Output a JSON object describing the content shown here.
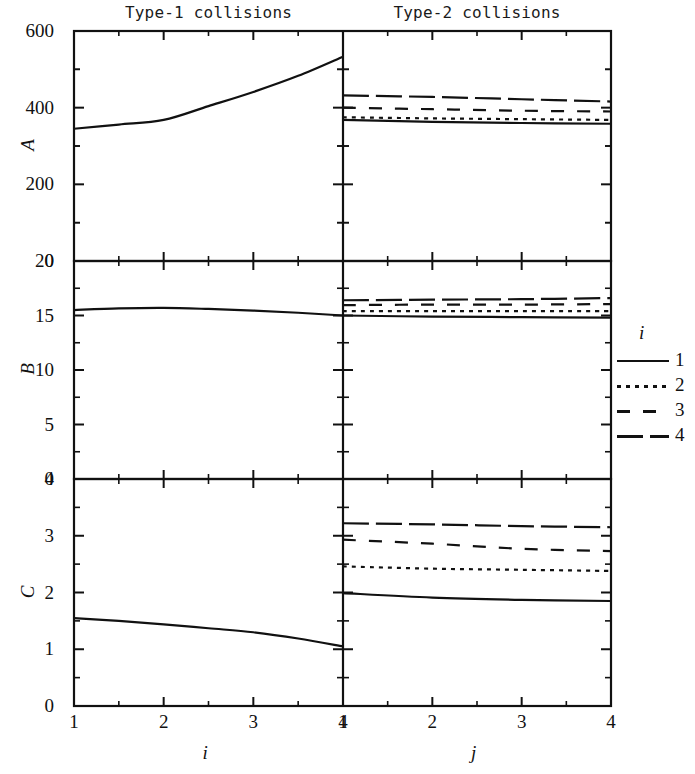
{
  "figure": {
    "width": 695,
    "height": 774,
    "background": "#ffffff",
    "ink_color": "#111111"
  },
  "columns": [
    {
      "id": "type1",
      "title": "Type-1 collisions",
      "xlabel": "i"
    },
    {
      "id": "type2",
      "title": "Type-2 collisions",
      "xlabel": "j"
    }
  ],
  "rows": [
    {
      "id": "A",
      "label": "A"
    },
    {
      "id": "B",
      "label": "B"
    },
    {
      "id": "C",
      "label": "C"
    }
  ],
  "legend": {
    "title": "i",
    "position": "right",
    "entries": [
      {
        "label": "1",
        "style": "solid"
      },
      {
        "label": "2",
        "style": "dotted"
      },
      {
        "label": "3",
        "style": "dashed"
      },
      {
        "label": "4",
        "style": "longdash"
      }
    ]
  },
  "chart_data": {
    "type": "line",
    "title": "",
    "layout": "3 rows (A, B, C) x 2 columns (Type-1 collisions, Type-2 collisions)",
    "grid": false,
    "legend_position": "right",
    "legend_title": "i",
    "panels": [
      {
        "row": "A",
        "column": "type1",
        "title": "Type-1 collisions",
        "xlabel": "i",
        "ylabel": "A",
        "xlim": [
          1,
          4
        ],
        "ylim": [
          0,
          600
        ],
        "xticks": [
          1,
          2,
          3,
          4
        ],
        "yticks": [
          0,
          200,
          400,
          600
        ],
        "yminorticks": [
          100,
          300,
          500
        ],
        "series": [
          {
            "name": "1",
            "style": "solid",
            "x": [
              1,
              1.5,
              2,
              2.5,
              3,
              3.5,
              4
            ],
            "values": [
              345,
              356,
              368,
              404,
              441,
              483,
              533
            ]
          }
        ]
      },
      {
        "row": "A",
        "column": "type2",
        "title": "Type-2 collisions",
        "xlabel": "j",
        "ylabel": "A",
        "xlim": [
          1,
          4
        ],
        "ylim": [
          0,
          600
        ],
        "xticks": [
          1,
          2,
          3,
          4
        ],
        "yticks": [
          0,
          200,
          400,
          600
        ],
        "yminorticks": [
          100,
          300,
          500
        ],
        "series": [
          {
            "name": "1",
            "style": "solid",
            "x": [
              1,
              2,
              3,
              4
            ],
            "values": [
              368,
              363,
              360,
              358
            ]
          },
          {
            "name": "2",
            "style": "dotted",
            "x": [
              1,
              2,
              3,
              4
            ],
            "values": [
              375,
              372,
              370,
              368
            ]
          },
          {
            "name": "3",
            "style": "dashed",
            "x": [
              1,
              2,
              3,
              4
            ],
            "values": [
              400,
              396,
              392,
              390
            ]
          },
          {
            "name": "4",
            "style": "longdash",
            "x": [
              1,
              2,
              3,
              4
            ],
            "values": [
              432,
              428,
              422,
              416
            ]
          }
        ]
      },
      {
        "row": "B",
        "column": "type1",
        "title": "",
        "xlabel": "i",
        "ylabel": "B",
        "xlim": [
          1,
          4
        ],
        "ylim": [
          0,
          20
        ],
        "xticks": [
          1,
          2,
          3,
          4
        ],
        "yticks": [
          0,
          5,
          10,
          15,
          20
        ],
        "series": [
          {
            "name": "1",
            "style": "solid",
            "x": [
              1,
              1.5,
              2,
              2.5,
              3,
              3.5,
              4
            ],
            "values": [
              15.5,
              15.65,
              15.7,
              15.6,
              15.45,
              15.25,
              15.0
            ]
          }
        ]
      },
      {
        "row": "B",
        "column": "type2",
        "title": "",
        "xlabel": "j",
        "ylabel": "B",
        "xlim": [
          1,
          4
        ],
        "ylim": [
          0,
          20
        ],
        "xticks": [
          1,
          2,
          3,
          4
        ],
        "yticks": [
          0,
          5,
          10,
          15,
          20
        ],
        "series": [
          {
            "name": "1",
            "style": "solid",
            "x": [
              1,
              2,
              3,
              4
            ],
            "values": [
              15.0,
              14.9,
              14.85,
              14.8
            ]
          },
          {
            "name": "2",
            "style": "dotted",
            "x": [
              1,
              2,
              3,
              4
            ],
            "values": [
              15.4,
              15.4,
              15.4,
              15.4
            ]
          },
          {
            "name": "3",
            "style": "dashed",
            "x": [
              1,
              2,
              3,
              4
            ],
            "values": [
              15.95,
              16.0,
              16.0,
              16.05
            ]
          },
          {
            "name": "4",
            "style": "longdash",
            "x": [
              1,
              2,
              3,
              4
            ],
            "values": [
              16.4,
              16.45,
              16.5,
              16.6
            ]
          }
        ]
      },
      {
        "row": "C",
        "column": "type1",
        "title": "",
        "xlabel": "i",
        "ylabel": "C",
        "xlim": [
          1,
          4
        ],
        "ylim": [
          0,
          4
        ],
        "xticks": [
          1,
          2,
          3,
          4
        ],
        "yticks": [
          0,
          1,
          2,
          3,
          4
        ],
        "series": [
          {
            "name": "1",
            "style": "solid",
            "x": [
              1,
              1.5,
              2,
              2.5,
              3,
              3.5,
              4
            ],
            "values": [
              1.55,
              1.5,
              1.44,
              1.37,
              1.3,
              1.19,
              1.05
            ]
          }
        ]
      },
      {
        "row": "C",
        "column": "type2",
        "title": "",
        "xlabel": "j",
        "ylabel": "C",
        "xlim": [
          1,
          4
        ],
        "ylim": [
          0,
          4
        ],
        "xticks": [
          1,
          2,
          3,
          4
        ],
        "yticks": [
          0,
          1,
          2,
          3,
          4
        ],
        "series": [
          {
            "name": "1",
            "style": "solid",
            "x": [
              1,
              2,
              3,
              4
            ],
            "values": [
              1.99,
              1.91,
              1.87,
              1.85
            ]
          },
          {
            "name": "2",
            "style": "dotted",
            "x": [
              1,
              2,
              3,
              4
            ],
            "values": [
              2.46,
              2.42,
              2.4,
              2.38
            ]
          },
          {
            "name": "3",
            "style": "dashed",
            "x": [
              1,
              2,
              3,
              4
            ],
            "values": [
              2.93,
              2.86,
              2.77,
              2.73
            ]
          },
          {
            "name": "4",
            "style": "longdash",
            "x": [
              1,
              2,
              3,
              4
            ],
            "values": [
              3.22,
              3.2,
              3.17,
              3.15
            ]
          }
        ]
      }
    ]
  }
}
